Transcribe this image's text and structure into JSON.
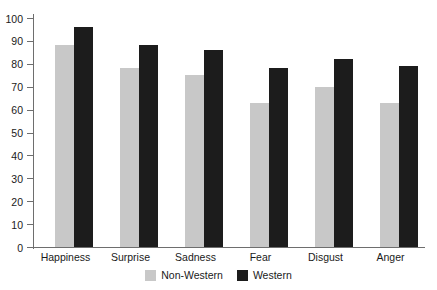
{
  "chart_data": {
    "type": "bar",
    "title": "",
    "subtitle": "",
    "xlabel": "",
    "ylabel": "",
    "categories": [
      "Happiness",
      "Surprise",
      "Sadness",
      "Fear",
      "Disgust",
      "Anger"
    ],
    "series": [
      {
        "name": "Non-Western",
        "color": "#c8c8c8",
        "values": [
          88,
          78,
          75,
          63,
          70,
          63
        ]
      },
      {
        "name": "Western",
        "color": "#1c1c1c",
        "values": [
          96,
          88,
          86,
          78,
          82,
          79
        ]
      }
    ],
    "ylim": [
      0,
      100
    ],
    "ytick_step": 10,
    "yticks": [
      0,
      10,
      20,
      30,
      40,
      50,
      60,
      70,
      80,
      90,
      100
    ],
    "ytick_labels": [
      "0",
      "10",
      "20",
      "30",
      "40",
      "50",
      "60",
      "70",
      "80",
      "90",
      "100"
    ],
    "grid": false,
    "legend_position": "bottom-center",
    "legend": [
      "Non-Western",
      "Western"
    ]
  },
  "axis": {
    "ticks": [
      {
        "value": 100,
        "label": "100"
      },
      {
        "value": 90,
        "label": "90"
      },
      {
        "value": 80,
        "label": "80"
      },
      {
        "value": 70,
        "label": "70"
      },
      {
        "value": 60,
        "label": "60"
      },
      {
        "value": 50,
        "label": "50"
      },
      {
        "value": 40,
        "label": "40"
      },
      {
        "value": 30,
        "label": "30"
      },
      {
        "value": 20,
        "label": "20"
      },
      {
        "value": 10,
        "label": "10"
      },
      {
        "value": 0,
        "label": "0"
      }
    ]
  }
}
